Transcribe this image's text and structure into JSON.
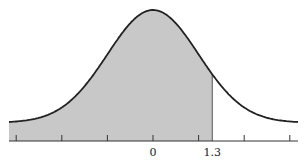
{
  "chart_data": {
    "type": "area",
    "title": "",
    "xlabel": "",
    "ylabel": "",
    "distribution": "standard normal",
    "mean": 0,
    "sd": 1,
    "shaded_region": {
      "from": "-inf",
      "to": 1.3
    },
    "xlim": [
      -3.17,
      3.17
    ],
    "tick_positions": [
      -3,
      -2,
      -1,
      0,
      1,
      2,
      3
    ],
    "tick_labels": [
      {
        "value": 0,
        "label": "0"
      },
      {
        "value": 1.3,
        "label": "1.3"
      }
    ],
    "grid": false,
    "legend": null,
    "colors": {
      "fill": "#c8c8c8",
      "curve": "#222222",
      "axis": "#333333"
    }
  }
}
